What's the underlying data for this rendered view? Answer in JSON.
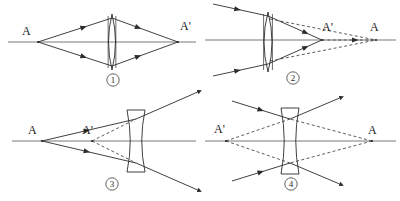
{
  "figure": {
    "stroke_color": "#2b2b2b",
    "axis_color": "#555555",
    "dashed_color": "#4a4a4a",
    "background": "#ffffff",
    "width": 400,
    "height": 201
  },
  "panels": [
    {
      "id": "panel-1",
      "number": "①",
      "number_x": 113,
      "number_y": 80,
      "lens_type": "biconvex",
      "lens_cx": 112,
      "lens_top": 14,
      "lens_bottom": 70,
      "lens_half_thickness": 7,
      "axis_y": 42,
      "axis_x1": 8,
      "axis_x2": 196,
      "object_label": "A",
      "object_label_x": 22,
      "object_label_y": 35,
      "object_x": 38,
      "image_label": "A'",
      "image_label_x": 180,
      "image_label_y": 30,
      "image_x": 178,
      "ray_spread": 24,
      "ray_style": "solid",
      "real_image": true
    },
    {
      "id": "panel-2",
      "number": "②",
      "number_x": 293,
      "number_y": 78,
      "lens_type": "biconvex",
      "lens_cx": 268,
      "lens_top": 12,
      "lens_bottom": 72,
      "lens_half_thickness": 8,
      "axis_y": 40,
      "axis_x1": 205,
      "axis_x2": 396,
      "object_label": "A",
      "object_label_x": 370,
      "object_label_y": 31,
      "object_x": 376,
      "image_label": "A'",
      "image_label_x": 322,
      "image_label_y": 31,
      "image_x": 322,
      "ray_spread": 24,
      "ray_style": "solid-with-dashed-extension",
      "real_image": true
    },
    {
      "id": "panel-3",
      "number": "③",
      "number_x": 112,
      "number_y": 184,
      "lens_type": "biconcave",
      "lens_cx": 136,
      "lens_top": 110,
      "lens_bottom": 172,
      "lens_half_thickness": 9,
      "axis_y": 141,
      "axis_x1": 12,
      "axis_x2": 196,
      "object_label": "A",
      "object_label_x": 28,
      "object_label_y": 134,
      "object_x": 42,
      "image_label": "A'",
      "image_label_x": 82,
      "image_label_y": 134,
      "image_x": 92,
      "ray_spread": 22,
      "ray_style": "solid-with-dashed-virtual",
      "real_image": false
    },
    {
      "id": "panel-4",
      "number": "④",
      "number_x": 291,
      "number_y": 184,
      "lens_type": "biconcave",
      "lens_cx": 290,
      "lens_top": 108,
      "lens_bottom": 174,
      "lens_half_thickness": 9,
      "axis_y": 141,
      "axis_x1": 205,
      "axis_x2": 396,
      "object_label": "A",
      "object_label_x": 368,
      "object_label_y": 134,
      "object_x": 372,
      "image_label": "A'",
      "image_label_x": 214,
      "image_label_y": 133,
      "image_x": 226,
      "ray_spread": 22,
      "ray_style": "dashed-virtual-both",
      "real_image": false
    }
  ],
  "labels": {
    "object_point": "A",
    "image_point": "A'",
    "numbers": [
      "①",
      "②",
      "③",
      "④"
    ]
  }
}
